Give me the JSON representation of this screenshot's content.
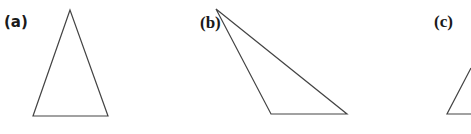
{
  "figure": {
    "panels": [
      {
        "label": "(a)",
        "shape": "triangle",
        "description": "acute isosceles-like triangle with apex at top",
        "vertices": [
          [
            70,
            10
          ],
          [
            33,
            116
          ],
          [
            108,
            116
          ]
        ]
      },
      {
        "label": "(b)",
        "shape": "triangle",
        "description": "obtuse triangle with apex at top-left",
        "vertices": [
          [
            216,
            9
          ],
          [
            271,
            114
          ],
          [
            347,
            114
          ]
        ]
      },
      {
        "label": "(c)",
        "shape": "triangle",
        "description": "triangle partially cut off at right edge",
        "vertices": [
          [
            447,
            114
          ],
          [
            471,
            68
          ],
          [
            471,
            114
          ]
        ]
      }
    ],
    "stroke_color": "#444444",
    "label_color": "#1a1a1a",
    "background": "#ffffff"
  }
}
